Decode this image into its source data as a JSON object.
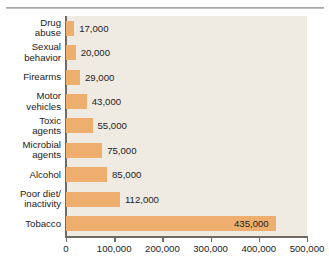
{
  "chart_data": {
    "type": "bar",
    "orientation": "horizontal",
    "title": "",
    "xlabel": "",
    "ylabel": "",
    "xlim": [
      0,
      500000
    ],
    "grid": false,
    "legend": false,
    "categories": [
      "Drug abuse",
      "Sexual behavior",
      "Firearms",
      "Motor vehicles",
      "Toxic agents",
      "Microbial agents",
      "Alcohol",
      "Poor diet/ inactivity",
      "Tobacco"
    ],
    "values": [
      17000,
      20000,
      29000,
      43000,
      55000,
      75000,
      85000,
      112000,
      435000
    ],
    "value_labels": [
      "17,000",
      "20,000",
      "29,000",
      "43,000",
      "55,000",
      "75,000",
      "85,000",
      "112,000",
      "435,000"
    ],
    "xticks": [
      0,
      100000,
      200000,
      300000,
      400000,
      500000
    ],
    "xtick_labels": [
      "0",
      "100,000",
      "200,000",
      "300,000",
      "400,000",
      "500,000"
    ],
    "bar_color": "#eeae6d",
    "plot_background": "#efebe3",
    "axis_color": "#6f6a63",
    "text_color": "#222222"
  },
  "rows": [
    {
      "label_line1": "Drug",
      "label_line2": "abuse",
      "value_label": "17,000",
      "label_position": "outside"
    },
    {
      "label_line1": "Sexual",
      "label_line2": "behavior",
      "value_label": "20,000",
      "label_position": "outside"
    },
    {
      "label_line1": "Firearms",
      "label_line2": "",
      "value_label": "29,000",
      "label_position": "outside"
    },
    {
      "label_line1": "Motor",
      "label_line2": "vehicles",
      "value_label": "43,000",
      "label_position": "outside"
    },
    {
      "label_line1": "Toxic",
      "label_line2": "agents",
      "value_label": "55,000",
      "label_position": "outside"
    },
    {
      "label_line1": "Microbial",
      "label_line2": "agents",
      "value_label": "75,000",
      "label_position": "outside"
    },
    {
      "label_line1": "Alcohol",
      "label_line2": "",
      "value_label": "85,000",
      "label_position": "outside"
    },
    {
      "label_line1": "Poor diet/",
      "label_line2": "inactivity",
      "value_label": "112,000",
      "label_position": "outside"
    },
    {
      "label_line1": "Tobacco",
      "label_line2": "",
      "value_label": "435,000",
      "label_position": "inside"
    }
  ]
}
